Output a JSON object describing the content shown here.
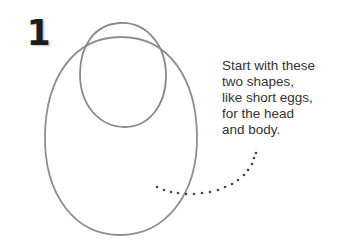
{
  "step": {
    "number": "1"
  },
  "caption": {
    "lines": [
      "Start with these",
      "two shapes,",
      "like short eggs,",
      "for the head",
      "and body."
    ]
  },
  "shapes": {
    "head": {
      "label": "head-oval"
    },
    "body": {
      "label": "body-oval"
    }
  },
  "colors": {
    "pencil": "#8a8a8a",
    "text": "#333333",
    "number": "#1c1c1c",
    "dots": "#444444"
  }
}
